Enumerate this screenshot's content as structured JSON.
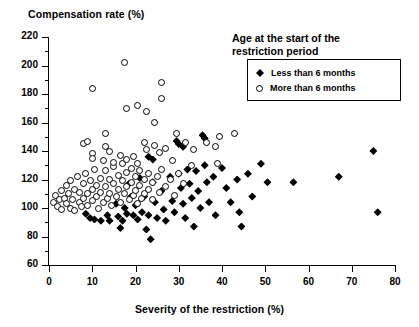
{
  "chart_data": {
    "type": "scatter",
    "title": "",
    "xlabel": "Severity of the restriction (%)",
    "ylabel": "Compensation rate (%)",
    "xlim": [
      0,
      80
    ],
    "ylim": [
      60,
      220
    ],
    "xticks": [
      0,
      10,
      20,
      30,
      40,
      50,
      60,
      70,
      80
    ],
    "yticks": [
      60,
      80,
      100,
      120,
      140,
      160,
      180,
      200,
      220
    ],
    "yminor_ticks": [
      70,
      90,
      110,
      130,
      150,
      170,
      190,
      210
    ],
    "grid": false,
    "legend_position": "top-right",
    "legend_title": "Age at the start of the restriction period",
    "series": [
      {
        "name": "Less than 6 months",
        "marker": "filled-diamond",
        "color": "#000000",
        "points": [
          [
            8.5,
            96
          ],
          [
            9.5,
            93
          ],
          [
            10.5,
            92
          ],
          [
            12.0,
            91
          ],
          [
            13.5,
            95
          ],
          [
            14.0,
            91
          ],
          [
            15.5,
            103
          ],
          [
            16.0,
            94
          ],
          [
            16.5,
            86
          ],
          [
            17.0,
            91
          ],
          [
            17.5,
            100
          ],
          [
            18.0,
            96
          ],
          [
            18.5,
            117
          ],
          [
            19.0,
            108
          ],
          [
            19.5,
            95
          ],
          [
            20.0,
            102
          ],
          [
            20.5,
            92
          ],
          [
            21.0,
            121
          ],
          [
            21.5,
            97
          ],
          [
            22.0,
            108
          ],
          [
            22.5,
            85
          ],
          [
            23.0,
            95
          ],
          [
            23.5,
            78
          ],
          [
            24.0,
            118
          ],
          [
            24.5,
            104
          ],
          [
            25.0,
            93
          ],
          [
            26.0,
            112
          ],
          [
            26.5,
            99
          ],
          [
            27.0,
            91
          ],
          [
            28.0,
            122
          ],
          [
            28.5,
            105
          ],
          [
            29.0,
            97
          ],
          [
            30.0,
            124
          ],
          [
            30.5,
            114
          ],
          [
            31.0,
            103
          ],
          [
            31.5,
            93
          ],
          [
            32.0,
            127
          ],
          [
            32.5,
            117
          ],
          [
            33.0,
            107
          ],
          [
            33.5,
            87
          ],
          [
            34.0,
            126
          ],
          [
            34.5,
            112
          ],
          [
            35.0,
            100
          ],
          [
            36.0,
            130
          ],
          [
            36.5,
            118
          ],
          [
            37.0,
            104
          ],
          [
            38.0,
            122
          ],
          [
            38.5,
            95
          ],
          [
            40.0,
            128
          ],
          [
            41.0,
            114
          ],
          [
            42.0,
            104
          ],
          [
            43.5,
            120
          ],
          [
            44.0,
            97
          ],
          [
            44.5,
            87
          ],
          [
            46.0,
            124
          ],
          [
            47.0,
            108
          ],
          [
            49.0,
            131
          ],
          [
            50.5,
            118
          ],
          [
            56.5,
            118
          ],
          [
            67.0,
            122
          ],
          [
            75.0,
            140
          ],
          [
            76.0,
            97
          ],
          [
            29.5,
            147
          ],
          [
            30.0,
            145
          ],
          [
            31.0,
            143
          ],
          [
            35.5,
            151
          ],
          [
            36.0,
            149
          ],
          [
            23.0,
            136
          ],
          [
            24.0,
            134
          ]
        ]
      },
      {
        "name": "More than 6 months",
        "marker": "open-circle",
        "color": "#000000",
        "points": [
          [
            1.0,
            104
          ],
          [
            1.5,
            109
          ],
          [
            2.0,
            101
          ],
          [
            2.5,
            106
          ],
          [
            3.0,
            112
          ],
          [
            3.0,
            99
          ],
          [
            3.5,
            107
          ],
          [
            4.0,
            116
          ],
          [
            4.0,
            103
          ],
          [
            4.5,
            110
          ],
          [
            5.0,
            100
          ],
          [
            5.0,
            119
          ],
          [
            5.5,
            106
          ],
          [
            6.0,
            113
          ],
          [
            6.0,
            98
          ],
          [
            6.5,
            122
          ],
          [
            7.0,
            104
          ],
          [
            7.0,
            111
          ],
          [
            7.5,
            101
          ],
          [
            8.0,
            117
          ],
          [
            8.0,
            107
          ],
          [
            8.5,
            124
          ],
          [
            9.0,
            110
          ],
          [
            9.0,
            102
          ],
          [
            9.5,
            119
          ],
          [
            10.0,
            113
          ],
          [
            10.0,
            105
          ],
          [
            10.5,
            127
          ],
          [
            11.0,
            108
          ],
          [
            11.0,
            116
          ],
          [
            11.5,
            100
          ],
          [
            12.0,
            121
          ],
          [
            12.0,
            111
          ],
          [
            12.5,
            104
          ],
          [
            13.0,
            126
          ],
          [
            13.0,
            115
          ],
          [
            13.5,
            107
          ],
          [
            14.0,
            120
          ],
          [
            14.0,
            110
          ],
          [
            14.5,
            102
          ],
          [
            15.0,
            129
          ],
          [
            15.0,
            117
          ],
          [
            15.5,
            108
          ],
          [
            16.0,
            123
          ],
          [
            16.0,
            113
          ],
          [
            16.5,
            104
          ],
          [
            17.0,
            131
          ],
          [
            17.0,
            119
          ],
          [
            17.5,
            110
          ],
          [
            18.0,
            125
          ],
          [
            18.0,
            115
          ],
          [
            18.5,
            106
          ],
          [
            19.0,
            128
          ],
          [
            19.0,
            118
          ],
          [
            19.5,
            109
          ],
          [
            20.0,
            122
          ],
          [
            20.0,
            112
          ],
          [
            20.5,
            103
          ],
          [
            21.0,
            126
          ],
          [
            21.0,
            116
          ],
          [
            21.5,
            107
          ],
          [
            22.0,
            120
          ],
          [
            22.0,
            110
          ],
          [
            23.0,
            124
          ],
          [
            23.0,
            113
          ],
          [
            24.0,
            118
          ],
          [
            24.0,
            106
          ],
          [
            25.0,
            122
          ],
          [
            25.5,
            111
          ],
          [
            26.0,
            127
          ],
          [
            27.0,
            115
          ],
          [
            28.0,
            120
          ],
          [
            29.0,
            109
          ],
          [
            30.0,
            124
          ],
          [
            31.0,
            117
          ],
          [
            8.0,
            145
          ],
          [
            9.0,
            147
          ],
          [
            10.0,
            138
          ],
          [
            10.0,
            135
          ],
          [
            12.5,
            133
          ],
          [
            13.0,
            143
          ],
          [
            14.0,
            140
          ],
          [
            15.0,
            132
          ],
          [
            16.5,
            137
          ],
          [
            18.0,
            134
          ],
          [
            19.5,
            136
          ],
          [
            20.5,
            131
          ],
          [
            22.0,
            146
          ],
          [
            22.5,
            141
          ],
          [
            24.5,
            144
          ],
          [
            25.5,
            139
          ],
          [
            27.0,
            142
          ],
          [
            28.5,
            133
          ],
          [
            33.0,
            130
          ],
          [
            39.0,
            131
          ],
          [
            43.0,
            152
          ],
          [
            10.0,
            184
          ],
          [
            17.5,
            202
          ],
          [
            18.0,
            170
          ],
          [
            20.5,
            172
          ],
          [
            22.5,
            168
          ],
          [
            24.5,
            160
          ],
          [
            26.0,
            188
          ],
          [
            26.0,
            177
          ],
          [
            29.5,
            152
          ],
          [
            31.5,
            146
          ],
          [
            33.5,
            141
          ],
          [
            36.5,
            146
          ],
          [
            38.5,
            143
          ],
          [
            39.5,
            150
          ],
          [
            13.0,
            152
          ]
        ]
      }
    ]
  },
  "axis": {
    "y_title": "Compensation rate (%)",
    "x_title": "Severity of the restriction (%)",
    "y_tick_labels": [
      "220",
      "200",
      "180",
      "160",
      "140",
      "120",
      "100",
      "80",
      "60"
    ],
    "x_tick_labels": [
      "0",
      "10",
      "20",
      "30",
      "40",
      "50",
      "60",
      "70",
      "80"
    ]
  },
  "legend": {
    "title_line1": "Age at the start of the",
    "title_line2": "restriction period",
    "entries": [
      {
        "label": "Less than 6 months",
        "marker": "filled-diamond"
      },
      {
        "label": "More than 6 months",
        "marker": "open-circle"
      }
    ]
  }
}
